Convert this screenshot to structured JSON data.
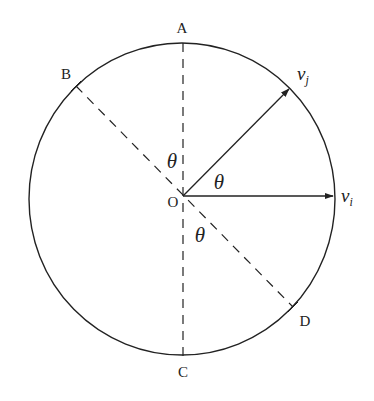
{
  "diagram": {
    "type": "circle-geometry",
    "center": {
      "label": "O",
      "x": 183,
      "y": 196
    },
    "circle": {
      "cx": 182,
      "cy": 199,
      "rx": 153,
      "ry": 156,
      "stroke": "#222222"
    },
    "points": [
      {
        "id": "A",
        "label": "A",
        "on_circle": {
          "x": 183,
          "y": 43
        },
        "label_pos": {
          "x": 182,
          "y": 33
        }
      },
      {
        "id": "B",
        "label": "B",
        "on_circle": {
          "x": 76,
          "y": 86
        },
        "label_pos": {
          "x": 66,
          "y": 79
        }
      },
      {
        "id": "C",
        "label": "C",
        "on_circle": {
          "x": 183,
          "y": 356
        },
        "label_pos": {
          "x": 183,
          "y": 377
        }
      },
      {
        "id": "D",
        "label": "D",
        "on_circle": {
          "x": 293,
          "y": 307
        },
        "label_pos": {
          "x": 305,
          "y": 326
        }
      }
    ],
    "dashed_lines": [
      {
        "name": "line-AC",
        "from": "A",
        "to": "C"
      },
      {
        "name": "line-BD",
        "from": "B",
        "to": "D"
      }
    ],
    "vectors": [
      {
        "id": "vj",
        "base": "v",
        "subscript": "j",
        "tip": {
          "x": 290,
          "y": 88
        },
        "label_pos": {
          "x": 297,
          "y": 80
        }
      },
      {
        "id": "vi",
        "base": "v",
        "subscript": "i",
        "tip": {
          "x": 334,
          "y": 196
        },
        "label_pos": {
          "x": 341,
          "y": 202
        }
      }
    ],
    "angles": [
      {
        "name": "angle-AOB",
        "label": "θ",
        "pos": {
          "x": 172,
          "y": 168
        }
      },
      {
        "name": "angle-vi-vj",
        "label": "θ",
        "pos": {
          "x": 219,
          "y": 189
        }
      },
      {
        "name": "angle-COD",
        "label": "θ",
        "pos": {
          "x": 200,
          "y": 242
        }
      }
    ],
    "origin_label": {
      "text": "O",
      "pos": {
        "x": 173,
        "y": 207
      }
    }
  }
}
